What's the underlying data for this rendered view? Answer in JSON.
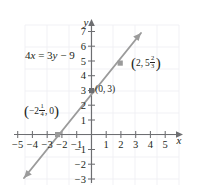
{
  "figure": {
    "type": "coordinate-graph",
    "equation": {
      "full": "4x = 3y − 9",
      "lhs_coeff": "4",
      "lhs_var": "x",
      "equals": "=",
      "rhs_coeff": "3",
      "rhs_var": "y",
      "rhs_op": "−",
      "rhs_const": "9"
    },
    "axis_labels": {
      "x": "x",
      "y": "y"
    },
    "x_ticks": [
      "−5",
      "−4",
      "−3",
      "−2",
      "−1",
      "1",
      "2",
      "3",
      "4",
      "5"
    ],
    "y_ticks": [
      "7",
      "6",
      "5",
      "4",
      "3",
      "2",
      "1",
      "−1",
      "−2",
      "−3"
    ],
    "points": [
      {
        "name": "point-upper-right",
        "label_plain": "(2, 5 2/3)",
        "x_text": "2",
        "sep": ",",
        "y_whole": "5",
        "y_frac_num": "2",
        "y_frac_den": "3",
        "x_value": 2,
        "y_value": 5.6667
      },
      {
        "name": "point-y-intercept",
        "label_plain": "(0, 3)",
        "x_text": "0",
        "sep": ",",
        "y_whole": "3",
        "x_value": 0,
        "y_value": 3
      },
      {
        "name": "point-x-intercept",
        "label_plain": "(−2 1/4, 0)",
        "x_whole": "−2",
        "x_frac_num": "1",
        "x_frac_den": "4",
        "sep": ",",
        "y_text": "0",
        "x_value": -2.25,
        "y_value": 0
      }
    ],
    "line": {
      "slope": "4/3",
      "y_intercept": 3
    },
    "colors": {
      "line": "#8c8c8c",
      "axis": "#58595b",
      "grid": "#ededf2",
      "text": "#231f20",
      "marker": "#9a9a9a"
    }
  }
}
